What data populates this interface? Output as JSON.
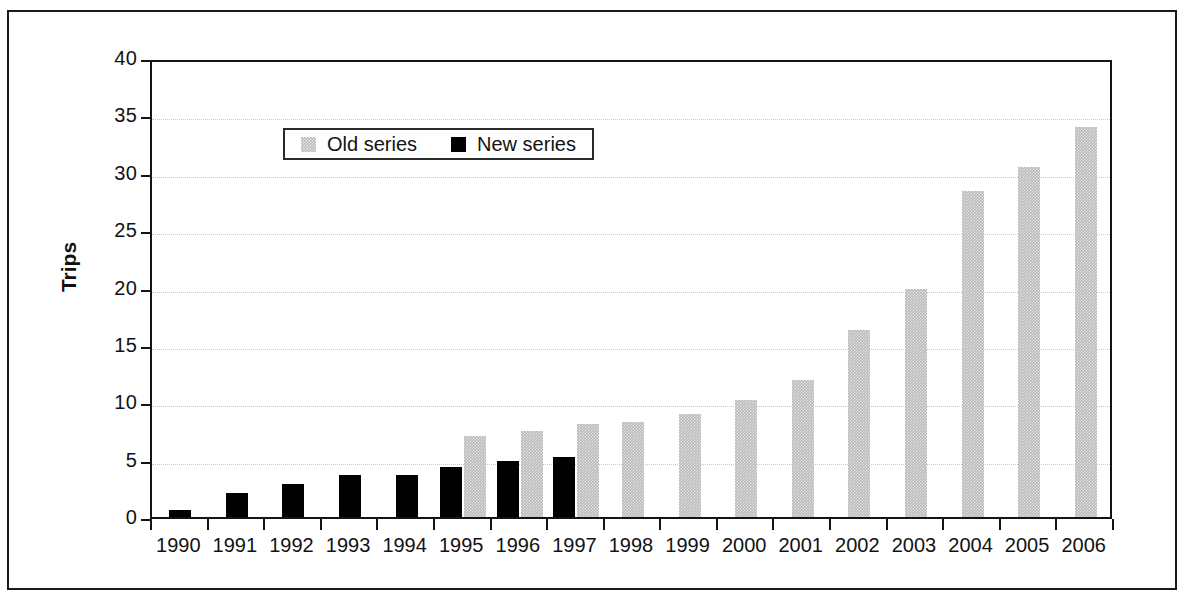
{
  "chart_data": {
    "type": "bar",
    "title": "",
    "subtitle": "",
    "xlabel": "",
    "ylabel": "Trips",
    "ylim": [
      0,
      40
    ],
    "ytick_step": 5,
    "yticks": [
      "0",
      "5",
      "10",
      "15",
      "20",
      "25",
      "30",
      "35",
      "40"
    ],
    "grid": true,
    "grid_style": "dotted-horizontal",
    "legend_position": "top-left-inside",
    "categories": [
      "1990",
      "1991",
      "1992",
      "1993",
      "1994",
      "1995",
      "1996",
      "1997",
      "1998",
      "1999",
      "2000",
      "2001",
      "2002",
      "2003",
      "2004",
      "2005",
      "2006"
    ],
    "series": [
      {
        "name": "Old series",
        "color": "#b9b9b9",
        "values": [
          null,
          null,
          null,
          null,
          null,
          7.1,
          7.5,
          8.1,
          8.3,
          9.0,
          10.2,
          11.9,
          16.3,
          19.9,
          28.4,
          30.5,
          34.0
        ]
      },
      {
        "name": "New series",
        "color": "#010101",
        "values": [
          0.6,
          2.1,
          2.9,
          3.7,
          3.7,
          4.4,
          4.9,
          5.2,
          null,
          null,
          null,
          null,
          null,
          null,
          null,
          null,
          null
        ]
      }
    ]
  },
  "legend": {
    "entries": [
      {
        "label": "Old series",
        "swatch": "old"
      },
      {
        "label": "New series",
        "swatch": "new"
      }
    ]
  },
  "axis": {
    "y_title": "Trips"
  },
  "colors": {
    "old_series": "#b9b9b9",
    "new_series": "#010101",
    "axis": "#141414",
    "gridline": "#c9c9c9",
    "frame": "#1a1a1a",
    "background": "#ffffff"
  }
}
